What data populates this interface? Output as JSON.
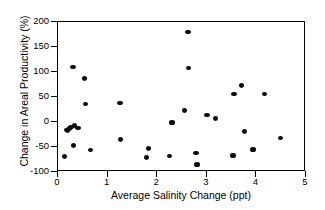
{
  "chart_data": {
    "type": "scatter",
    "title": "",
    "xlabel": "Average Salinity Change (ppt)",
    "ylabel": "Change in Areal Productivity (%)",
    "xlim": [
      0,
      5
    ],
    "ylim": [
      -100,
      200
    ],
    "xticks": [
      0,
      1,
      2,
      3,
      4,
      5
    ],
    "yticks": [
      -100,
      -50,
      0,
      50,
      100,
      150,
      200
    ],
    "xtick_labels": [
      "0",
      "1",
      "2",
      "3",
      "4",
      "5"
    ],
    "ytick_labels": [
      "-100",
      "-50",
      "0",
      "50",
      "100",
      "150",
      "200"
    ],
    "grid": false,
    "legend": null,
    "marker_color": "#0d0d0d",
    "marker_shape": "circle",
    "series": [
      {
        "name": "sites",
        "points": [
          [
            0.13,
            -69
          ],
          [
            0.17,
            -16
          ],
          [
            0.19,
            -17
          ],
          [
            0.21,
            -14
          ],
          [
            0.23,
            -13
          ],
          [
            0.25,
            -11
          ],
          [
            0.27,
            -10
          ],
          [
            0.3,
            110
          ],
          [
            0.31,
            -47
          ],
          [
            0.33,
            -7
          ],
          [
            0.4,
            -12
          ],
          [
            0.54,
            87
          ],
          [
            0.56,
            36
          ],
          [
            0.66,
            -56
          ],
          [
            1.25,
            38
          ],
          [
            1.26,
            -35
          ],
          [
            1.79,
            -71
          ],
          [
            1.83,
            -53
          ],
          [
            2.25,
            -68
          ],
          [
            2.3,
            -1
          ],
          [
            2.55,
            23
          ],
          [
            2.62,
            180
          ],
          [
            2.63,
            108
          ],
          [
            2.78,
            -62
          ],
          [
            2.8,
            -85
          ],
          [
            3.0,
            14
          ],
          [
            3.18,
            7
          ],
          [
            3.53,
            -67
          ],
          [
            3.55,
            56
          ],
          [
            3.7,
            73
          ],
          [
            3.76,
            -19
          ],
          [
            3.93,
            -55
          ],
          [
            4.16,
            56
          ],
          [
            4.48,
            -32
          ]
        ]
      }
    ]
  }
}
